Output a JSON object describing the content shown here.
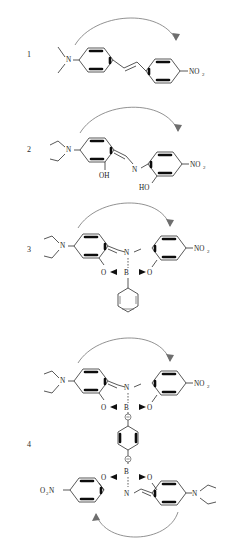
{
  "figure": {
    "type": "chemical-structure-series",
    "background": "#ffffff",
    "bond_color": "#3a3a3a",
    "bold_bond_color": "#0d0d0d",
    "arrow_color": "#6e6e6e"
  },
  "structures": [
    {
      "number": "1",
      "name": "4-dimethylamino-4'-nitrostilbene",
      "donor": "N",
      "donor_label": "N",
      "acceptor_label": "NO",
      "acceptor_sub": "2",
      "bridge": "trans-vinyl stilbene",
      "rings": 2,
      "arrow": "donor-to-acceptor"
    },
    {
      "number": "2",
      "name": "bis(salicylidene) Schiff base, diethylamino / nitro",
      "donor_label": "N",
      "imine_label": "N",
      "hydroxyl_left": "OH",
      "hydroxyl_right": "HO",
      "acceptor_label": "NO",
      "acceptor_sub": "2",
      "bridge": "azomethine (C=N)",
      "rings": 2,
      "arrow": "donor-to-acceptor"
    },
    {
      "number": "3",
      "name": "phenylboron chelate of the Schiff base",
      "donor_label": "N",
      "imine_label": "N",
      "boron_label": "B",
      "oxygen_left": "O",
      "oxygen_right": "O",
      "acceptor_label": "NO",
      "acceptor_sub": "2",
      "boron_substituent": "phenyl",
      "rings": 3,
      "arrow": "donor-to-acceptor"
    },
    {
      "number": "4",
      "name": "1,4-phenylene-bridged bis(boron chelate) dimer",
      "top": {
        "donor_label": "N",
        "imine_label": "N",
        "boron_label": "B",
        "oxygen_left": "O",
        "oxygen_right": "O",
        "acceptor_label": "NO",
        "acceptor_sub": "2",
        "charge": "⊖"
      },
      "bottom": {
        "donor_label": "N",
        "imine_label": "N",
        "boron_label": "B",
        "oxygen_left": "O",
        "oxygen_right": "O",
        "acceptor_label": "N",
        "acceptor_pre": "O",
        "acceptor_pre_sub": "2",
        "charge": "⊖"
      },
      "bridge": "1,4-phenylene",
      "rings": 5,
      "arrows": 2
    }
  ]
}
